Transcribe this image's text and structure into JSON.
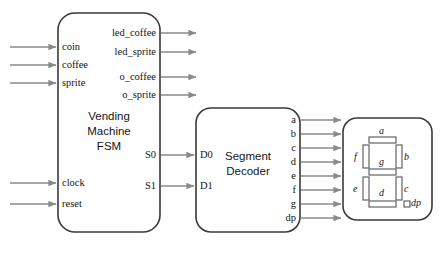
{
  "diagram": {
    "colors": {
      "block_stroke": "#3a3a3a",
      "wire": "#8a8a8a",
      "text": "#151515",
      "segment_stroke": "#555555",
      "background": "#ffffff"
    }
  },
  "blocks": {
    "fsm": {
      "name": "vending-machine-fsm",
      "label_line1": "Vending",
      "label_line2": "Machine",
      "label_line3": "FSM",
      "inputs": [
        {
          "label": "coin"
        },
        {
          "label": "coffee"
        },
        {
          "label": "sprite"
        },
        {
          "label": "clock"
        },
        {
          "label": "reset"
        }
      ],
      "outputs": [
        {
          "label": "led_coffee"
        },
        {
          "label": "led_sprite"
        },
        {
          "label": "o_coffee"
        },
        {
          "label": "o_sprite"
        },
        {
          "label": "S0"
        },
        {
          "label": "S1"
        }
      ]
    },
    "decoder": {
      "name": "segment-decoder",
      "label_line1": "Segment",
      "label_line2": "Decoder",
      "inputs": [
        {
          "label": "D0"
        },
        {
          "label": "D1"
        }
      ],
      "outputs": [
        {
          "label": "a"
        },
        {
          "label": "b"
        },
        {
          "label": "c"
        },
        {
          "label": "d"
        },
        {
          "label": "e"
        },
        {
          "label": "f"
        },
        {
          "label": "g"
        },
        {
          "label": "dp"
        }
      ]
    },
    "display": {
      "name": "seven-segment-display",
      "segments": [
        {
          "label": "a"
        },
        {
          "label": "b"
        },
        {
          "label": "c"
        },
        {
          "label": "d"
        },
        {
          "label": "e"
        },
        {
          "label": "f"
        },
        {
          "label": "g"
        },
        {
          "label": "dp"
        }
      ]
    }
  }
}
